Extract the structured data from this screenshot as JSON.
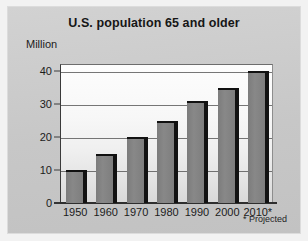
{
  "chart_data": {
    "type": "bar",
    "title": "U.S. population 65 and older",
    "xlabel": "",
    "ylabel": "Million",
    "categories": [
      "1950",
      "1960",
      "1970",
      "1980",
      "1990",
      "2000",
      "2010*"
    ],
    "values": [
      10,
      15,
      20,
      25,
      31,
      35,
      40
    ],
    "ylim": [
      0,
      40
    ],
    "ytick_labels": [
      "40",
      "30",
      "20",
      "10",
      "0"
    ],
    "ytick_values": [
      40,
      30,
      20,
      10,
      0
    ],
    "grid": true,
    "legend": "none",
    "annotation": "* Projected",
    "bar_color": "#7e7e7e",
    "bar_shadow_color": "#121212",
    "panel_color": "#cacaca",
    "plot_background": "#f7f7f7",
    "axis_color": "#2e2e2e",
    "text_color": "#1b1b1b"
  },
  "figure": {
    "title": "U.S. population 65 and older",
    "unit_caption": "Million",
    "footnote": "* Projected"
  }
}
